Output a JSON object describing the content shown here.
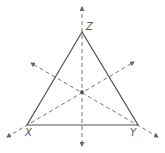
{
  "diagram": {
    "type": "triangle with concurrent dashed lines",
    "vertices": [
      {
        "label": "Z",
        "x": 82,
        "y": 32
      },
      {
        "label": "X",
        "x": 27,
        "y": 125
      },
      {
        "label": "Y",
        "x": 138,
        "y": 125
      }
    ],
    "intersection_point": {
      "x": 82,
      "y": 92
    },
    "colors": {
      "stroke": "#555555",
      "dashed": "#777777",
      "background": "#ffffff"
    }
  }
}
